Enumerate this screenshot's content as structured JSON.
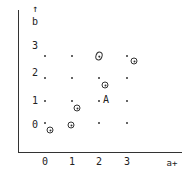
{
  "diagram": {
    "axes": {
      "y_label": "b",
      "y_arrow": "↑",
      "x_label": "a",
      "x_arrow": "+",
      "x_ticks": [
        "0",
        "1",
        "2",
        "3"
      ],
      "y_ticks": [
        "3",
        "2",
        "1",
        "0"
      ]
    },
    "grid": {
      "columns_a": [
        0,
        1,
        2,
        3
      ],
      "rows_b": [
        0,
        1,
        2,
        3
      ]
    },
    "circled_points": [
      {
        "near": [
          2,
          3
        ],
        "note": "circle on grid point"
      },
      {
        "near": [
          3,
          3
        ],
        "note": "circle offset lower-right"
      },
      {
        "near": [
          2,
          2
        ],
        "note": "circle offset lower-right"
      },
      {
        "near": [
          1,
          1
        ],
        "note": "circle offset lower-right"
      },
      {
        "near": [
          0,
          0
        ],
        "note": "circle offset lower-right"
      },
      {
        "near": [
          1,
          0
        ],
        "note": "circle on grid point"
      }
    ],
    "labeled_point": {
      "at": [
        2,
        1
      ],
      "label": "A"
    }
  }
}
